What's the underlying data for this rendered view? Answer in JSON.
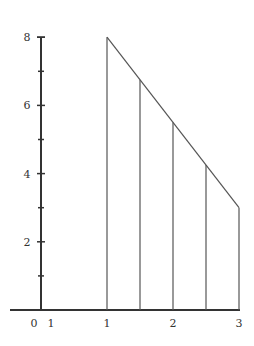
{
  "chart_data": {
    "type": "line",
    "title": "",
    "xlabel": "",
    "ylabel": "",
    "x": [
      1,
      3
    ],
    "series": [
      {
        "name": "f(x)",
        "points": [
          [
            1,
            8
          ],
          [
            3,
            3
          ]
        ]
      }
    ],
    "vertical_segments": [
      {
        "x": 1,
        "y_top": 8
      },
      {
        "x": 1.5,
        "y_top": 6.75
      },
      {
        "x": 2,
        "y_top": 5.5
      },
      {
        "x": 2.5,
        "y_top": 4.25
      },
      {
        "x": 3,
        "y_top": 3
      }
    ],
    "xlim": [
      0,
      3
    ],
    "ylim": [
      0,
      8
    ],
    "x_tick_labels": [
      {
        "x": 0,
        "label": "0"
      },
      {
        "x": 0.15,
        "label": "1"
      },
      {
        "x": 1,
        "label": "1"
      },
      {
        "x": 2,
        "label": "2"
      },
      {
        "x": 3,
        "label": "3"
      }
    ],
    "y_tick_labels": [
      {
        "y": 2,
        "label": "2"
      },
      {
        "y": 4,
        "label": "4"
      },
      {
        "y": 6,
        "label": "6"
      },
      {
        "y": 8,
        "label": "8"
      }
    ],
    "y_minor_ticks": [
      1,
      3,
      5,
      7
    ],
    "grid": false,
    "legend": null,
    "colors": {
      "axis": "#333333",
      "line": "#555555"
    }
  }
}
